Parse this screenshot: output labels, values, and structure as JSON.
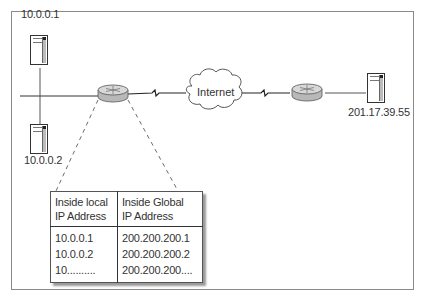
{
  "diagram": {
    "hosts": [
      {
        "id": "host-1",
        "label": "10.0.0.1"
      },
      {
        "id": "host-2",
        "label": "10.0.0.2"
      },
      {
        "id": "remote-server",
        "label": "201.17.39.55"
      }
    ],
    "cloud": {
      "label": "Internet"
    },
    "routers": [
      {
        "id": "inside-router",
        "role": "NAT router"
      },
      {
        "id": "remote-router",
        "role": "remote router"
      }
    ],
    "nat_table": {
      "headers": [
        {
          "line1": "Inside local",
          "line2": "IP Address"
        },
        {
          "line1": "Inside Global",
          "line2": "IP Address"
        }
      ],
      "rows": [
        {
          "local": "10.0.0.1",
          "global": "200.200.200.1"
        },
        {
          "local": "10.0.0.2",
          "global": "200.200.200.2"
        },
        {
          "local": "10..........",
          "global": "200.200.200...."
        }
      ]
    },
    "colors": {
      "line": "#333333",
      "router_body": "#b8b8b8",
      "router_top": "#d8d8d8",
      "frame": "#8a8a8a"
    }
  }
}
